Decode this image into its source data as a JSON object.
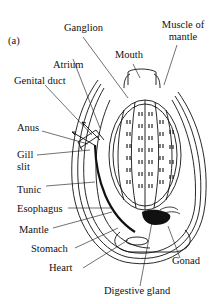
{
  "figure": {
    "panel_label": "(a)",
    "colors": {
      "ink": "#111111",
      "background": "#ffffff"
    }
  },
  "labels": {
    "ganglion": "Ganglion",
    "muscle_of_mantle_line1": "Muscle of",
    "muscle_of_mantle_line2": "mantle",
    "mouth": "Mouth",
    "atrium": "Atrium",
    "genital_duct": "Genital duct",
    "anus": "Anus",
    "gill_slit_line1": "Gill",
    "gill_slit_line2": "slit",
    "tunic": "Tunic",
    "esophagus": "Esophagus",
    "mantle": "Mantle",
    "stomach": "Stomach",
    "heart": "Heart",
    "gonad": "Gonad",
    "digestive_gland": "Digestive gland"
  }
}
